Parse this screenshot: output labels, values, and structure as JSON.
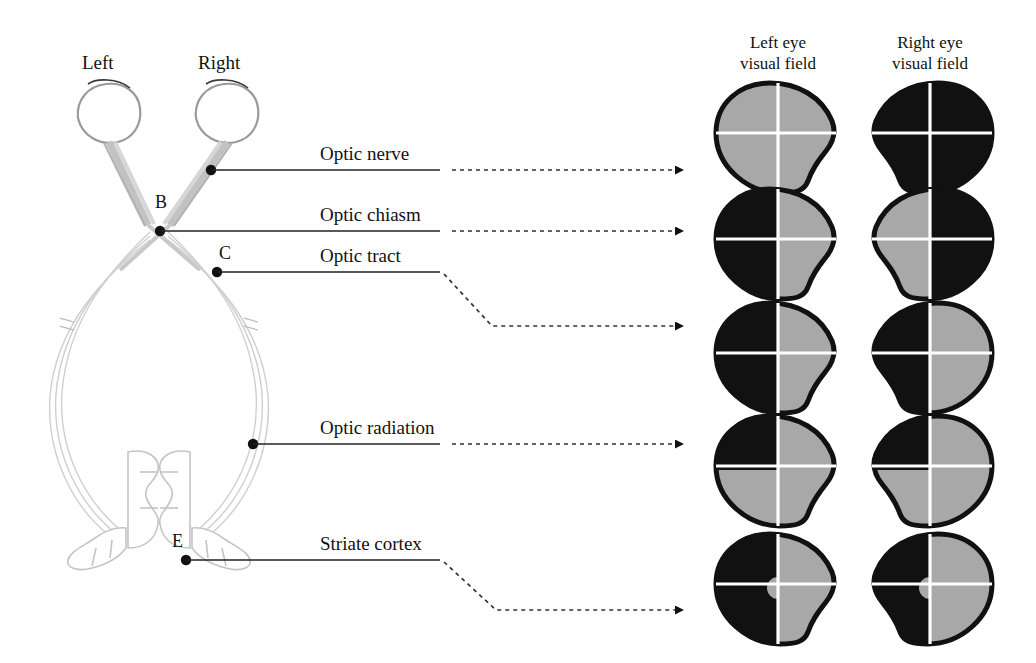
{
  "figure": {
    "type": "anatomical-diagram"
  },
  "eye_labels": [
    {
      "id": "left-eye",
      "text": "Left",
      "x": 108,
      "y": 60
    },
    {
      "id": "right-eye",
      "text": "Right",
      "x": 228,
      "y": 60
    }
  ],
  "point_labels": [
    {
      "id": "point-b",
      "text": "B",
      "x": 162,
      "y": 198
    },
    {
      "id": "point-c",
      "text": "C",
      "x": 224,
      "y": 248
    },
    {
      "id": "point-e",
      "text": "E",
      "x": 178,
      "y": 536
    }
  ],
  "column_headers": [
    {
      "id": "left-eye-field-header",
      "line1": "Left eye",
      "line2": "visual field",
      "cx": 778,
      "y": 32
    },
    {
      "id": "right-eye-field-header",
      "line1": "Right eye",
      "line2": "visual field",
      "cx": 930,
      "y": 32
    }
  ],
  "pathway_labels": [
    {
      "id": "optic-nerve",
      "text": "Optic nerve",
      "x": 320,
      "y": 140
    },
    {
      "id": "optic-chiasm",
      "text": "Optic chiasm",
      "x": 320,
      "y": 202
    },
    {
      "id": "optic-tract",
      "text": "Optic tract",
      "x": 320,
      "y": 248
    },
    {
      "id": "optic-radiation",
      "text": "Optic radiation",
      "x": 320,
      "y": 418
    },
    {
      "id": "striate-cortex",
      "text": "Striate cortex",
      "x": 320,
      "y": 530
    }
  ],
  "rows": [
    {
      "id": "row-optic-nerve",
      "lesion": "Optic nerve",
      "cy": 137,
      "left_eye": {
        "defect": "total-blindness-none",
        "pattern": "all-normal"
      },
      "right_eye": {
        "defect": "total-blindness",
        "pattern": "all-blind"
      }
    },
    {
      "id": "row-optic-chiasm",
      "lesion": "Optic chiasm",
      "cy": 243,
      "left_eye": {
        "defect": "bitemporal-hemianopia",
        "pattern": "left-half-blind"
      },
      "right_eye": {
        "defect": "bitemporal-hemianopia",
        "pattern": "right-half-blind"
      }
    },
    {
      "id": "row-optic-tract",
      "lesion": "Optic tract",
      "cy": 357,
      "left_eye": {
        "defect": "homonymous-hemianopia",
        "pattern": "left-half-blind"
      },
      "right_eye": {
        "defect": "homonymous-hemianopia",
        "pattern": "left-half-blind"
      }
    },
    {
      "id": "row-optic-radiation",
      "lesion": "Optic radiation",
      "cy": 470,
      "left_eye": {
        "defect": "superior-quadrantanopia",
        "pattern": "upper-left-quadrant-blind"
      },
      "right_eye": {
        "defect": "superior-quadrantanopia",
        "pattern": "upper-left-quadrant-blind"
      }
    },
    {
      "id": "row-striate-cortex",
      "lesion": "Striate cortex",
      "cy": 588,
      "left_eye": {
        "defect": "homonymous-hemianopia-macular-sparing",
        "pattern": "left-half-blind-macular-sparing"
      },
      "right_eye": {
        "defect": "homonymous-hemianopia-macular-sparing",
        "pattern": "left-half-blind-macular-sparing"
      }
    }
  ],
  "colors": {
    "blind": "#111111",
    "seeing": "#a8a8a8",
    "outline": "#111111",
    "crosshair": "#ffffff",
    "leader": "#222222",
    "anatomy_stroke": "#b8b8b8",
    "anatomy_stroke_dark": "#9a9a9a",
    "background": "#ffffff"
  }
}
